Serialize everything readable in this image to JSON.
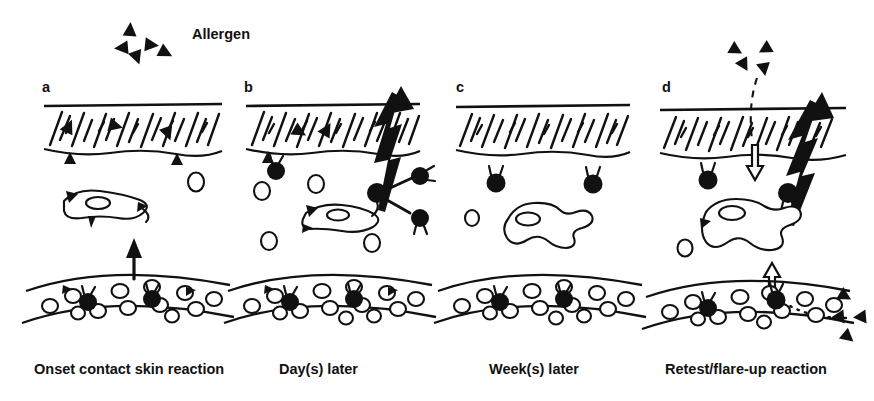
{
  "figure": {
    "title_label": "Allergen",
    "background_color": "#ffffff",
    "ink_color": "#111111",
    "width": 874,
    "height": 401
  },
  "legend": {
    "allergen_label": "Allergen",
    "allergen_marker": "filled-triangle",
    "marker_count": 5
  },
  "panels": [
    {
      "letter": "a",
      "caption": "Onset contact skin reaction",
      "stage": "onset",
      "features": {
        "stratum_corneum": "hatched-band",
        "allergen_in_corneum": 3,
        "epidermal_border": "wavy",
        "langerhans_cell": "activated-dendritic",
        "langerhans_outline": "solid-dendrites",
        "free_cells": 1,
        "t_cells_dermis": 0,
        "vessel_open_cells": 12,
        "vessel_dark_cells": 2,
        "arrow_up_solid": 1,
        "lightning_bolt": 0,
        "hollow_arrow": 0,
        "dashed_arrow": 0
      }
    },
    {
      "letter": "b",
      "caption": "Day(s) later",
      "stage": "days-later",
      "features": {
        "stratum_corneum": "hatched-band",
        "allergen_in_corneum": 2,
        "epidermal_border": "wavy",
        "langerhans_cell": "activated-dendritic",
        "langerhans_outline": "solid-dendrites",
        "free_cells": 4,
        "t_cells_dermis": 3,
        "vessel_open_cells": 13,
        "vessel_dark_cells": 2,
        "arrow_up_solid": 0,
        "lightning_bolt": 1,
        "hollow_arrow": 0,
        "dashed_arrow": 0
      }
    },
    {
      "letter": "c",
      "caption": "Week(s) later",
      "stage": "weeks-later",
      "features": {
        "stratum_corneum": "hatched-band",
        "allergen_in_corneum": 0,
        "epidermal_border": "wavy",
        "langerhans_cell": "resting-outline",
        "langerhans_outline": "open-no-dendrites",
        "free_cells": 1,
        "t_cells_dermis": 2,
        "vessel_open_cells": 13,
        "vessel_dark_cells": 2,
        "arrow_up_solid": 0,
        "lightning_bolt": 0,
        "hollow_arrow": 0,
        "dashed_arrow": 0
      }
    },
    {
      "letter": "d",
      "caption": "Retest/flare-up reaction",
      "stage": "retest-flare-up",
      "features": {
        "stratum_corneum": "hatched-band",
        "allergen_above_skin": 4,
        "allergen_outside_vessel": 4,
        "epidermal_border": "wavy",
        "langerhans_cell": "large-outline-memory",
        "langerhans_outline": "open-lobed",
        "free_cells": 2,
        "t_cells_dermis": 2,
        "vessel_open_cells": 12,
        "vessel_dark_cells": 2,
        "arrow_up_solid": 0,
        "lightning_bolt": 1,
        "hollow_arrow": 2,
        "dashed_arrow": 1,
        "dotted_path": 1
      }
    }
  ]
}
